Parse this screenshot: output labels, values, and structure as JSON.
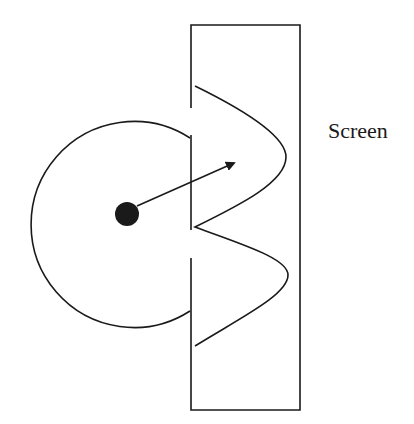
{
  "diagram": {
    "type": "wave-diffraction-schematic",
    "labels": {
      "screen": "Screen"
    },
    "elements": {
      "source": "point-source",
      "wavefront": "circular-wavefront",
      "barrier": "barrier-with-slits",
      "screen": "screen-rectangle",
      "propagation_arrow": "arrow",
      "intensity_pattern": "wave-pattern"
    },
    "colors": {
      "line": "#1a1a1a",
      "background": "#ffffff"
    }
  }
}
